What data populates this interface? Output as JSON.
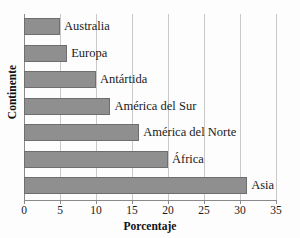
{
  "chart_data": {
    "type": "bar",
    "orientation": "horizontal",
    "title": "",
    "xlabel": "Porcentaje",
    "ylabel": "Continente",
    "xlim": [
      0,
      35
    ],
    "xticks": [
      0,
      5,
      10,
      15,
      20,
      25,
      30,
      35
    ],
    "grid": true,
    "legend": null,
    "bar_color": "#8f8f8f",
    "bar_edge_color": "#6e6e6e",
    "categories": [
      "Australia",
      "Europa",
      "Antártida",
      "América del Sur",
      "América del Norte",
      "África",
      "Asia"
    ],
    "values": [
      5,
      6,
      10,
      12,
      16,
      20,
      31
    ],
    "bars": [
      {
        "label": "Australia",
        "value": 5
      },
      {
        "label": "Europa",
        "value": 6
      },
      {
        "label": "Antártida",
        "value": 10
      },
      {
        "label": "América del Sur",
        "value": 12
      },
      {
        "label": "América del Norte",
        "value": 16
      },
      {
        "label": "África",
        "value": 20
      },
      {
        "label": "Asia",
        "value": 31
      }
    ]
  },
  "axes": {
    "x_title": "Porcentaje",
    "y_title": "Continente",
    "x_tick_labels": [
      "0",
      "5",
      "10",
      "15",
      "20",
      "25",
      "30",
      "35"
    ]
  }
}
